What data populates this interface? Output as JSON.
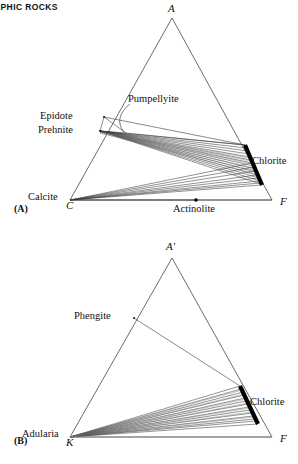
{
  "page": {
    "running_head": "RPHIC ROCKS",
    "width": 298,
    "height": 464
  },
  "style": {
    "line_color": "#5a5a5a",
    "tie_line_color": "#3a3a3a",
    "phase_bar_color": "#000000",
    "text_color": "#111111",
    "background": "#ffffff"
  },
  "diagrams": [
    {
      "tag": "(A)",
      "type": "ternary-ACF",
      "vertices": [
        {
          "name": "A",
          "label": "A",
          "x": 172,
          "y": 18,
          "label_x": 168,
          "label_y": 4
        },
        {
          "name": "C",
          "label": "C",
          "x": 70,
          "y": 200,
          "label_x": 66,
          "label_y": 201
        },
        {
          "name": "F",
          "label": "F",
          "x": 272,
          "y": 200,
          "label_x": 280,
          "label_y": 197
        }
      ],
      "phases": [
        {
          "name": "epidote",
          "label": "Epidote",
          "x": 104,
          "y": 117,
          "label_x": 42,
          "label_y": 110,
          "kind": "point"
        },
        {
          "name": "prehnite",
          "label": "Prehnite",
          "x": 100,
          "y": 131,
          "label_x": 40,
          "label_y": 124,
          "kind": "point"
        },
        {
          "name": "pumpellyite",
          "label": "Pumpellyite",
          "x": 126,
          "y": 133,
          "label_x": 128,
          "label_y": 95,
          "kind": "point-leader"
        },
        {
          "name": "chlorite",
          "label": "Chlorite",
          "x1": 245,
          "y1": 145,
          "x2": 262,
          "y2": 185,
          "label_x": 254,
          "label_y": 160,
          "kind": "bar"
        },
        {
          "name": "calcite",
          "label": "Calcite",
          "x": 70,
          "y": 200,
          "label_x": 29,
          "label_y": 192,
          "kind": "vertex-phase"
        },
        {
          "name": "actinolite",
          "label": "Actinolite",
          "x": 196,
          "y": 200,
          "label_x": 175,
          "label_y": 203,
          "kind": "point-dot"
        }
      ]
    },
    {
      "tag": "(B)",
      "type": "ternary-AKF",
      "vertices": [
        {
          "name": "A-prime",
          "label": "A′",
          "x": 172,
          "y": 258,
          "label_x": 167,
          "label_y": 243
        },
        {
          "name": "K",
          "label": "K",
          "x": 70,
          "y": 437,
          "label_x": 67,
          "label_y": 438
        },
        {
          "name": "F",
          "label": "F",
          "x": 272,
          "y": 437,
          "label_x": 280,
          "label_y": 434
        }
      ],
      "phases": [
        {
          "name": "phengite",
          "label": "Phengite",
          "x": 134,
          "y": 318,
          "label_x": 75,
          "label_y": 311,
          "kind": "point"
        },
        {
          "name": "chlorite",
          "label": "Chlorite",
          "x1": 240,
          "y1": 386,
          "x2": 258,
          "y2": 424,
          "label_x": 252,
          "label_y": 400,
          "kind": "bar"
        },
        {
          "name": "adularia",
          "label": "Adularia",
          "x": 70,
          "y": 437,
          "label_x": 22,
          "label_y": 429,
          "kind": "vertex-phase"
        }
      ]
    }
  ]
}
